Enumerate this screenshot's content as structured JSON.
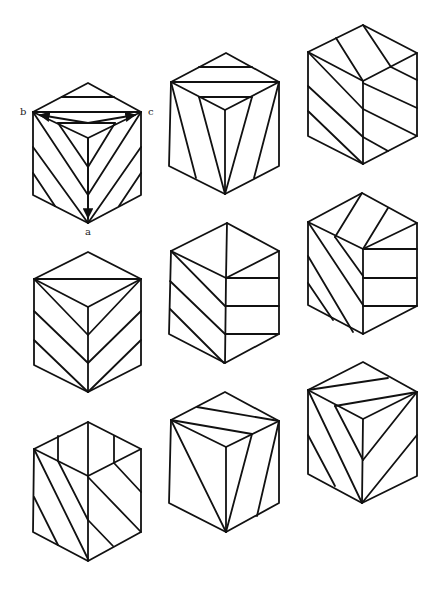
{
  "figure": {
    "labels": [
      {
        "text": "b",
        "x": 20,
        "y": 115
      },
      {
        "text": "c",
        "x": 148,
        "y": 115
      },
      {
        "text": "a",
        "x": 85,
        "y": 235
      }
    ],
    "line_color": "#111111",
    "background": "#ffffff"
  },
  "cubes": [
    {
      "id": "cube-1",
      "outline": [
        [
          88,
          83
        ],
        [
          141,
          112
        ],
        [
          141,
          195
        ],
        [
          88,
          223
        ],
        [
          33,
          195
        ],
        [
          33,
          112
        ]
      ],
      "edges": [
        [
          [
            88,
            138
          ],
          [
            33,
            112
          ]
        ],
        [
          [
            88,
            138
          ],
          [
            141,
            112
          ]
        ],
        [
          [
            88,
            138
          ],
          [
            88,
            223
          ]
        ]
      ],
      "lines": [
        [
          [
            62,
            97
          ],
          [
            114,
            97
          ]
        ],
        [
          [
            33,
            112
          ],
          [
            141,
            112
          ]
        ],
        [
          [
            58,
            123
          ],
          [
            115,
            123
          ]
        ],
        [
          [
            33,
            112
          ],
          [
            88,
            195
          ]
        ],
        [
          [
            58,
            123
          ],
          [
            88,
            167
          ]
        ],
        [
          [
            33,
            147
          ],
          [
            88,
            223
          ]
        ],
        [
          [
            33,
            173
          ],
          [
            55,
            206
          ]
        ],
        [
          [
            141,
            112
          ],
          [
            88,
            195
          ]
        ],
        [
          [
            115,
            123
          ],
          [
            88,
            167
          ]
        ],
        [
          [
            141,
            147
          ],
          [
            88,
            223
          ]
        ],
        [
          [
            141,
            173
          ],
          [
            119,
            206
          ]
        ]
      ],
      "arrows": [
        [
          [
            88,
            138
          ],
          [
            88,
            218
          ]
        ],
        [
          [
            88,
            123
          ],
          [
            40,
            115
          ]
        ],
        [
          [
            88,
            123
          ],
          [
            135,
            115
          ]
        ]
      ]
    },
    {
      "id": "cube-2",
      "outline": [
        [
          226,
          53
        ],
        [
          279,
          82
        ],
        [
          279,
          166
        ],
        [
          225,
          194
        ],
        [
          169,
          166
        ],
        [
          171,
          82
        ]
      ],
      "edges": [
        [
          [
            225,
            110
          ],
          [
            171,
            82
          ]
        ],
        [
          [
            225,
            110
          ],
          [
            279,
            82
          ]
        ],
        [
          [
            225,
            110
          ],
          [
            225,
            194
          ]
        ]
      ],
      "lines": [
        [
          [
            199,
            67
          ],
          [
            252,
            67
          ]
        ],
        [
          [
            171,
            82
          ],
          [
            279,
            82
          ]
        ],
        [
          [
            199,
            97
          ],
          [
            252,
            97
          ]
        ],
        [
          [
            171,
            82
          ],
          [
            196,
            178
          ]
        ],
        [
          [
            199,
            97
          ],
          [
            225,
            194
          ]
        ],
        [
          [
            279,
            82
          ],
          [
            254,
            178
          ]
        ],
        [
          [
            252,
            97
          ],
          [
            225,
            194
          ]
        ]
      ]
    },
    {
      "id": "cube-3",
      "outline": [
        [
          363,
          25
        ],
        [
          417,
          53
        ],
        [
          417,
          136
        ],
        [
          363,
          164
        ],
        [
          308,
          136
        ],
        [
          308,
          52
        ]
      ],
      "edges": [
        [
          [
            363,
            81
          ],
          [
            308,
            52
          ]
        ],
        [
          [
            363,
            81
          ],
          [
            417,
            53
          ]
        ],
        [
          [
            363,
            81
          ],
          [
            363,
            164
          ]
        ]
      ],
      "lines": [
        [
          [
            336,
            38
          ],
          [
            363,
            81
          ]
        ],
        [
          [
            363,
            25
          ],
          [
            391,
            67
          ]
        ],
        [
          [
            308,
            52
          ],
          [
            363,
            109
          ]
        ],
        [
          [
            308,
            86
          ],
          [
            363,
            137
          ]
        ],
        [
          [
            308,
            111
          ],
          [
            363,
            164
          ]
        ],
        [
          [
            363,
            83
          ],
          [
            417,
            108
          ]
        ],
        [
          [
            363,
            109
          ],
          [
            417,
            136
          ]
        ],
        [
          [
            363,
            137
          ],
          [
            388,
            151
          ]
        ],
        [
          [
            391,
            67
          ],
          [
            417,
            80
          ]
        ]
      ]
    },
    {
      "id": "cube-4",
      "outline": [
        [
          88,
          252
        ],
        [
          141,
          279
        ],
        [
          141,
          365
        ],
        [
          88,
          392
        ],
        [
          34,
          365
        ],
        [
          34,
          279
        ]
      ],
      "edges": [
        [
          [
            88,
            307
          ],
          [
            34,
            279
          ]
        ],
        [
          [
            88,
            307
          ],
          [
            141,
            279
          ]
        ],
        [
          [
            88,
            307
          ],
          [
            88,
            392
          ]
        ]
      ],
      "lines": [
        [
          [
            34,
            279
          ],
          [
            141,
            279
          ]
        ],
        [
          [
            34,
            279
          ],
          [
            88,
            335
          ]
        ],
        [
          [
            34,
            311
          ],
          [
            88,
            363
          ]
        ],
        [
          [
            34,
            340
          ],
          [
            88,
            392
          ]
        ],
        [
          [
            141,
            279
          ],
          [
            88,
            335
          ]
        ],
        [
          [
            141,
            311
          ],
          [
            88,
            363
          ]
        ],
        [
          [
            141,
            340
          ],
          [
            88,
            392
          ]
        ]
      ]
    },
    {
      "id": "cube-5",
      "outline": [
        [
          227,
          223
        ],
        [
          279,
          251
        ],
        [
          279,
          334
        ],
        [
          225,
          363
        ],
        [
          169,
          334
        ],
        [
          171,
          251
        ]
      ],
      "edges": [
        [
          [
            226,
            278
          ],
          [
            171,
            251
          ]
        ],
        [
          [
            226,
            278
          ],
          [
            279,
            251
          ]
        ],
        [
          [
            226,
            278
          ],
          [
            225,
            363
          ]
        ]
      ],
      "lines": [
        [
          [
            227,
            223
          ],
          [
            226,
            278
          ]
        ],
        [
          [
            171,
            251
          ],
          [
            225,
            306
          ]
        ],
        [
          [
            170,
            281
          ],
          [
            225,
            334
          ]
        ],
        [
          [
            170,
            309
          ],
          [
            224,
            363
          ]
        ],
        [
          [
            226,
            278
          ],
          [
            279,
            278
          ]
        ],
        [
          [
            226,
            306
          ],
          [
            279,
            306
          ]
        ],
        [
          [
            226,
            334
          ],
          [
            279,
            334
          ]
        ]
      ]
    },
    {
      "id": "cube-6",
      "outline": [
        [
          362,
          193
        ],
        [
          417,
          223
        ],
        [
          417,
          306
        ],
        [
          363,
          334
        ],
        [
          308,
          305
        ],
        [
          308,
          222
        ]
      ],
      "edges": [
        [
          [
            363,
            249
          ],
          [
            308,
            222
          ]
        ],
        [
          [
            363,
            249
          ],
          [
            417,
            223
          ]
        ],
        [
          [
            363,
            249
          ],
          [
            363,
            334
          ]
        ]
      ],
      "lines": [
        [
          [
            362,
            193
          ],
          [
            335,
            237
          ]
        ],
        [
          [
            388,
            208
          ],
          [
            363,
            249
          ]
        ],
        [
          [
            308,
            222
          ],
          [
            363,
            305
          ]
        ],
        [
          [
            335,
            237
          ],
          [
            363,
            276
          ]
        ],
        [
          [
            308,
            256
          ],
          [
            353,
            332
          ]
        ],
        [
          [
            308,
            283
          ],
          [
            333,
            320
          ]
        ],
        [
          [
            363,
            249
          ],
          [
            417,
            249
          ]
        ],
        [
          [
            363,
            278
          ],
          [
            417,
            278
          ]
        ],
        [
          [
            363,
            306
          ],
          [
            417,
            306
          ]
        ]
      ]
    },
    {
      "id": "cube-7",
      "outline": [
        [
          88,
          422
        ],
        [
          141,
          449
        ],
        [
          141,
          532
        ],
        [
          88,
          561
        ],
        [
          33,
          532
        ],
        [
          34,
          449
        ]
      ],
      "edges": [
        [
          [
            88,
            476
          ],
          [
            34,
            449
          ]
        ],
        [
          [
            88,
            476
          ],
          [
            141,
            449
          ]
        ],
        [
          [
            88,
            476
          ],
          [
            88,
            561
          ]
        ]
      ],
      "lines": [
        [
          [
            88,
            422
          ],
          [
            88,
            476
          ]
        ],
        [
          [
            58,
            436
          ],
          [
            58,
            461
          ]
        ],
        [
          [
            114,
            436
          ],
          [
            114,
            463
          ]
        ],
        [
          [
            34,
            449
          ],
          [
            88,
            559
          ]
        ],
        [
          [
            58,
            461
          ],
          [
            88,
            520
          ]
        ],
        [
          [
            34,
            497
          ],
          [
            58,
            545
          ]
        ],
        [
          [
            88,
            477
          ],
          [
            141,
            532
          ]
        ],
        [
          [
            88,
            520
          ],
          [
            113,
            546
          ]
        ],
        [
          [
            114,
            463
          ],
          [
            141,
            492
          ]
        ]
      ]
    },
    {
      "id": "cube-8",
      "outline": [
        [
          225,
          392
        ],
        [
          279,
          421
        ],
        [
          279,
          503
        ],
        [
          226,
          532
        ],
        [
          169,
          503
        ],
        [
          171,
          420
        ]
      ],
      "edges": [
        [
          [
            226,
            447
          ],
          [
            171,
            420
          ]
        ],
        [
          [
            226,
            447
          ],
          [
            279,
            421
          ]
        ],
        [
          [
            226,
            447
          ],
          [
            226,
            532
          ]
        ]
      ],
      "lines": [
        [
          [
            197,
            407
          ],
          [
            279,
            421
          ]
        ],
        [
          [
            171,
            420
          ],
          [
            252,
            434
          ]
        ],
        [
          [
            171,
            420
          ],
          [
            226,
            532
          ]
        ],
        [
          [
            252,
            434
          ],
          [
            226,
            532
          ]
        ],
        [
          [
            279,
            421
          ],
          [
            257,
            516
          ]
        ]
      ]
    },
    {
      "id": "cube-9",
      "outline": [
        [
          363,
          362
        ],
        [
          417,
          392
        ],
        [
          417,
          476
        ],
        [
          362,
          503
        ],
        [
          308,
          474
        ],
        [
          308,
          390
        ]
      ],
      "edges": [
        [
          [
            363,
            419
          ],
          [
            308,
            390
          ]
        ],
        [
          [
            363,
            419
          ],
          [
            417,
            392
          ]
        ],
        [
          [
            363,
            419
          ],
          [
            362,
            503
          ]
        ]
      ],
      "lines": [
        [
          [
            308,
            390
          ],
          [
            388,
            378
          ]
        ],
        [
          [
            335,
            406
          ],
          [
            417,
            392
          ]
        ],
        [
          [
            308,
            390
          ],
          [
            362,
            503
          ]
        ],
        [
          [
            335,
            406
          ],
          [
            363,
            460
          ]
        ],
        [
          [
            308,
            435
          ],
          [
            335,
            486
          ]
        ],
        [
          [
            417,
            392
          ],
          [
            363,
            460
          ]
        ],
        [
          [
            417,
            435
          ],
          [
            362,
            503
          ]
        ]
      ]
    }
  ]
}
